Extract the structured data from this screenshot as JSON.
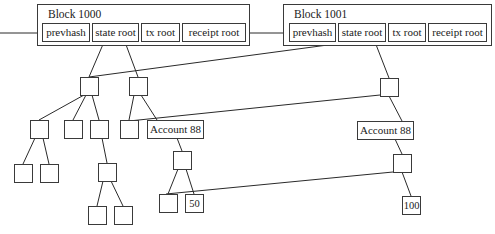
{
  "diagram": {
    "type": "merkle-patricia-state-trie",
    "blocks": [
      {
        "title": "Block 1000",
        "fields": [
          "prevhash",
          "state root",
          "tx root",
          "receipt root"
        ]
      },
      {
        "title": "Block 1001",
        "fields": [
          "prevhash",
          "state root",
          "tx root",
          "receipt root"
        ]
      }
    ],
    "accounts": {
      "left_label": "Account 88",
      "right_label": "Account 88"
    },
    "leaf_values": {
      "old_balance": "50",
      "new_balance": "100"
    }
  }
}
